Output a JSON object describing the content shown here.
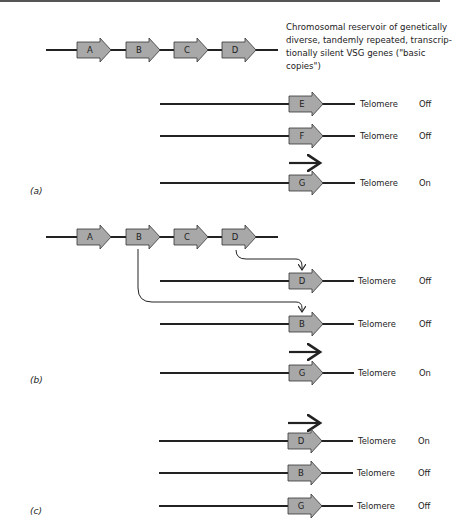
{
  "description_lines": [
    "Chromosomal reservoir of genetically",
    "diverse, tandemly repeated, transcrip-",
    "tionally silent VSG genes (\"basic",
    "copies\")"
  ],
  "reservoir_genes": [
    "A",
    "B",
    "C",
    "D"
  ],
  "telomere_label": "Telomere",
  "panels": [
    {
      "label": "(a)",
      "rows": [
        {
          "gene": "E",
          "telomere": "Telomere",
          "status": "Off",
          "transcribed": false
        },
        {
          "gene": "F",
          "telomere": "Telomere",
          "status": "Off",
          "transcribed": false
        },
        {
          "gene": "G",
          "telomere": "Telomere",
          "status": "On",
          "transcribed": true
        }
      ]
    },
    {
      "label": "(b)",
      "rows": [
        {
          "gene": "D",
          "telomere": "Telomere",
          "status": "Off",
          "transcribed": false,
          "copied_from": "D"
        },
        {
          "gene": "B",
          "telomere": "Telomere",
          "status": "Off",
          "transcribed": false,
          "copied_from": "B"
        },
        {
          "gene": "G",
          "telomere": "Telomere",
          "status": "On",
          "transcribed": true
        }
      ]
    },
    {
      "label": "(c)",
      "rows": [
        {
          "gene": "D",
          "telomere": "Telomere",
          "status": "On",
          "transcribed": true
        },
        {
          "gene": "B",
          "telomere": "Telomere",
          "status": "Off",
          "transcribed": false
        },
        {
          "gene": "G",
          "telomere": "Telomere",
          "status": "Off",
          "transcribed": false
        }
      ]
    }
  ],
  "colors": {
    "gene_fill": "#a8a8a8",
    "line": "#222222"
  }
}
